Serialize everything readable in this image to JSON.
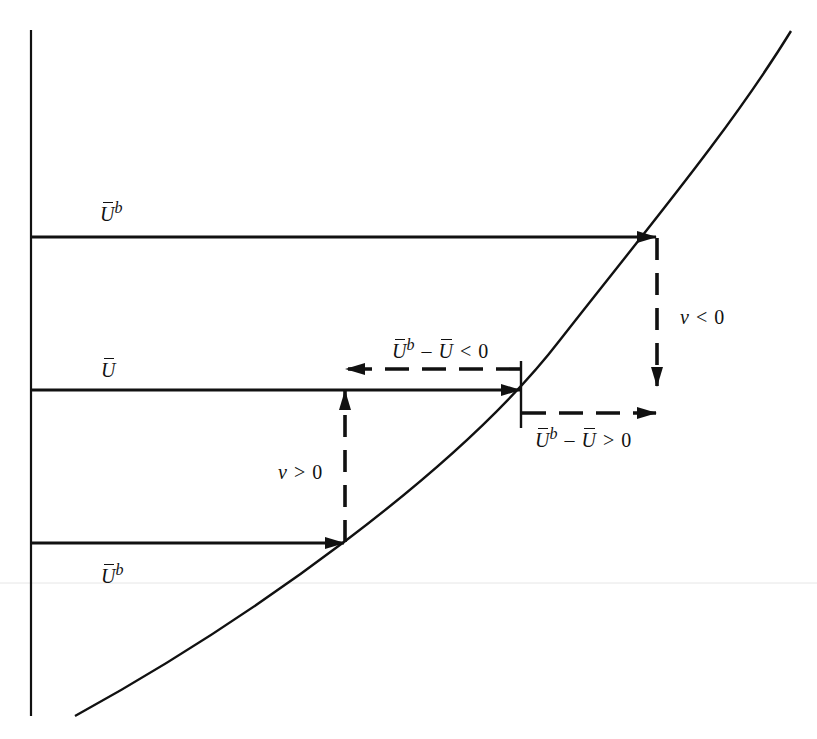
{
  "diagram": {
    "stroke_color": "#111111",
    "background": "#ffffff",
    "axis": {
      "x": 31,
      "y_top": 30,
      "y_bottom": 716
    },
    "curve": {
      "start": [
        75,
        716
      ],
      "end": [
        791,
        31
      ]
    },
    "labels": {
      "top_left": {
        "symbol": "U",
        "superscript": "b"
      },
      "middle_left": {
        "symbol": "U"
      },
      "bottom_left": {
        "symbol": "U",
        "superscript": "b"
      },
      "v_negative": {
        "var": "v",
        "op": "<",
        "value": "0"
      },
      "v_positive": {
        "var": "v",
        "op": ">",
        "value": "0"
      },
      "diff_negative": {
        "a": "U",
        "a_sup": "b",
        "minus": "–",
        "b": "U",
        "op": "<",
        "value": "0"
      },
      "diff_positive": {
        "a": "U",
        "a_sup": "b",
        "minus": "–",
        "b": "U",
        "op": ">",
        "value": "0"
      }
    },
    "arrows": [
      {
        "name": "top-solid-arrow",
        "style": "solid",
        "from": [
          31,
          237
        ],
        "to": [
          657,
          237
        ]
      },
      {
        "name": "middle-solid-arrow",
        "style": "solid",
        "from": [
          31,
          390
        ],
        "to": [
          521,
          390
        ]
      },
      {
        "name": "bottom-solid-arrow",
        "style": "solid",
        "from": [
          31,
          543
        ],
        "to": [
          345,
          543
        ]
      },
      {
        "name": "v-negative-dashed-arrow",
        "style": "dashed",
        "from": [
          657,
          237
        ],
        "to": [
          657,
          387
        ]
      },
      {
        "name": "v-positive-dashed-arrow",
        "style": "dashed",
        "from": [
          345,
          543
        ],
        "to": [
          345,
          390
        ]
      },
      {
        "name": "diff-negative-dashed-arrow",
        "style": "dashed",
        "from": [
          521,
          369
        ],
        "to": [
          345,
          369
        ]
      },
      {
        "name": "diff-positive-dashed-arrow",
        "style": "dashed",
        "from": [
          521,
          413
        ],
        "to": [
          657,
          413
        ]
      }
    ]
  }
}
